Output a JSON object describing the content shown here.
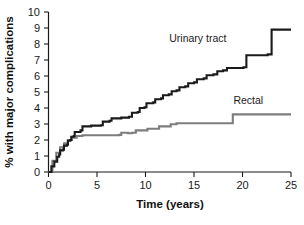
{
  "chart_data": {
    "type": "line",
    "title": "",
    "subtitle": "",
    "xlabel": "Time (years)",
    "ylabel": "% with major complications",
    "xlim": [
      0,
      25
    ],
    "ylim": [
      0,
      10
    ],
    "xticks": [
      0,
      5,
      10,
      15,
      20,
      25
    ],
    "yticks": [
      0,
      1,
      2,
      3,
      4,
      5,
      6,
      7,
      8,
      9,
      10
    ],
    "xtick_labels": [
      "0",
      "5",
      "10",
      "15",
      "20",
      "25"
    ],
    "ytick_labels": [
      "0",
      "1",
      "2",
      "3",
      "4",
      "5",
      "6",
      "7",
      "8",
      "9",
      "10"
    ],
    "grid": false,
    "legend_position": "inline-annotations",
    "step_style": "kaplan-meier step curves",
    "series": [
      {
        "name": "Urinary tract",
        "color": "#1a1a1a",
        "line_width": 2.1,
        "label_position": {
          "x": 15.4,
          "y": 8.15
        },
        "points": [
          [
            0.0,
            0.0
          ],
          [
            0.3,
            0.35
          ],
          [
            0.6,
            0.65
          ],
          [
            0.9,
            0.95
          ],
          [
            1.1,
            1.1
          ],
          [
            1.2,
            1.35
          ],
          [
            1.5,
            1.4
          ],
          [
            1.6,
            1.65
          ],
          [
            1.9,
            1.7
          ],
          [
            2.0,
            1.95
          ],
          [
            2.25,
            2.0
          ],
          [
            2.35,
            2.2
          ],
          [
            2.6,
            2.25
          ],
          [
            2.7,
            2.5
          ],
          [
            3.3,
            2.6
          ],
          [
            3.5,
            2.85
          ],
          [
            4.4,
            2.9
          ],
          [
            5.4,
            2.92
          ],
          [
            5.6,
            3.15
          ],
          [
            6.3,
            3.2
          ],
          [
            6.5,
            3.35
          ],
          [
            7.5,
            3.4
          ],
          [
            8.3,
            3.45
          ],
          [
            8.6,
            3.7
          ],
          [
            9.2,
            3.75
          ],
          [
            9.4,
            4.0
          ],
          [
            9.9,
            4.05
          ],
          [
            10.1,
            4.3
          ],
          [
            10.8,
            4.35
          ],
          [
            11.0,
            4.55
          ],
          [
            11.6,
            4.6
          ],
          [
            11.8,
            4.8
          ],
          [
            12.4,
            4.85
          ],
          [
            12.7,
            5.05
          ],
          [
            13.2,
            5.1
          ],
          [
            13.5,
            5.3
          ],
          [
            14.1,
            5.35
          ],
          [
            14.4,
            5.55
          ],
          [
            15.0,
            5.6
          ],
          [
            15.3,
            5.8
          ],
          [
            16.0,
            5.85
          ],
          [
            16.3,
            6.05
          ],
          [
            17.0,
            6.1
          ],
          [
            17.4,
            6.3
          ],
          [
            18.0,
            6.35
          ],
          [
            18.4,
            6.5
          ],
          [
            20.1,
            6.55
          ],
          [
            20.4,
            7.3
          ],
          [
            22.6,
            7.35
          ],
          [
            23.0,
            8.9
          ],
          [
            25.0,
            8.9
          ]
        ]
      },
      {
        "name": "Rectal",
        "color": "#7d7d7d",
        "line_width": 2.1,
        "label_position": {
          "x": 20.6,
          "y": 4.25
        },
        "points": [
          [
            0.0,
            0.0
          ],
          [
            0.4,
            0.7
          ],
          [
            0.8,
            1.2
          ],
          [
            1.2,
            1.55
          ],
          [
            1.6,
            1.8
          ],
          [
            2.0,
            2.0
          ],
          [
            2.4,
            2.15
          ],
          [
            2.9,
            2.25
          ],
          [
            3.5,
            2.3
          ],
          [
            7.3,
            2.32
          ],
          [
            7.5,
            2.45
          ],
          [
            8.2,
            2.42
          ],
          [
            8.6,
            2.45
          ],
          [
            9.0,
            2.6
          ],
          [
            10.2,
            2.7
          ],
          [
            11.4,
            2.85
          ],
          [
            12.6,
            2.98
          ],
          [
            13.2,
            3.05
          ],
          [
            17.9,
            3.05
          ],
          [
            19.0,
            3.6
          ],
          [
            25.0,
            3.6
          ]
        ]
      }
    ],
    "annotations": [
      {
        "text": "Urinary tract",
        "series": "Urinary tract"
      },
      {
        "text": "Rectal",
        "series": "Rectal"
      }
    ]
  },
  "axes": {
    "x_axis_title": "Time (years)",
    "y_axis_title": "% with major complications",
    "x_tick_labels": [
      "0",
      "5",
      "10",
      "15",
      "20",
      "25"
    ],
    "y_tick_labels": [
      "10",
      "9",
      "8",
      "7",
      "6",
      "5",
      "4",
      "3",
      "2",
      "1",
      "0"
    ]
  },
  "caption": {
    "text": "",
    "visible": false
  },
  "colors": {
    "axis": "#1a1a1a",
    "urinary_tract": "#1a1a1a",
    "rectal": "#7d7d7d",
    "background": "#ffffff"
  }
}
